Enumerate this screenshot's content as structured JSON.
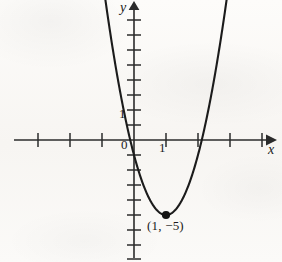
{
  "figure": {
    "part_label": ")",
    "axis_labels": {
      "x": "x",
      "y": "y"
    },
    "tick_labels": {
      "origin": "0",
      "x_one": "1",
      "y_one": "1"
    },
    "annotations": [
      {
        "name": "vertex-label",
        "text": "(1, −5)"
      }
    ],
    "colors": {
      "ink": "#1b1b1b",
      "axis": "#2b2b2b",
      "paper": "#fbfaf8"
    }
  },
  "chart_data": {
    "type": "line",
    "title": "",
    "xlabel": "x",
    "ylabel": "y",
    "grid": false,
    "legend": null,
    "xlim": [
      -3.05,
      4.1
    ],
    "ylim": [
      -8.1,
      9.3
    ],
    "x_ticks": [
      -3,
      -2,
      -1,
      0,
      1,
      2,
      3,
      4
    ],
    "y_ticks": [
      -8,
      -7,
      -6,
      -5,
      -4,
      -3,
      -2,
      -1,
      0,
      1,
      2,
      3,
      4,
      5,
      6,
      7,
      8,
      9
    ],
    "x_tick_labels_shown": {
      "0": "0",
      "1": "1"
    },
    "y_tick_labels_shown": {
      "1": "1"
    },
    "series": [
      {
        "name": "parabola",
        "equation": "y = 4(x - 1)^2 - 5",
        "vertex": [
          1,
          -5
        ],
        "opens": "up",
        "a": 4,
        "x_intercepts": [
          -0.118,
          2.118
        ],
        "y_intercept": -1,
        "x": [
          -0.92,
          -0.7,
          -0.5,
          -0.3,
          -0.1,
          0.1,
          0.3,
          0.5,
          0.7,
          0.9,
          1.1,
          1.3,
          1.5,
          1.7,
          1.9,
          2.1,
          2.3,
          2.5,
          2.7,
          2.92
        ],
        "y": [
          9.75,
          6.56,
          4.0,
          1.76,
          -0.16,
          -1.76,
          -3.04,
          -4.0,
          -4.64,
          -4.96,
          -4.96,
          -4.64,
          -4.0,
          -3.04,
          -1.76,
          -0.16,
          1.76,
          4.0,
          6.56,
          9.75
        ]
      }
    ],
    "points": [
      {
        "label": "(1, −5)",
        "x": 1,
        "y": -5,
        "marker": "filled-circle"
      }
    ]
  }
}
